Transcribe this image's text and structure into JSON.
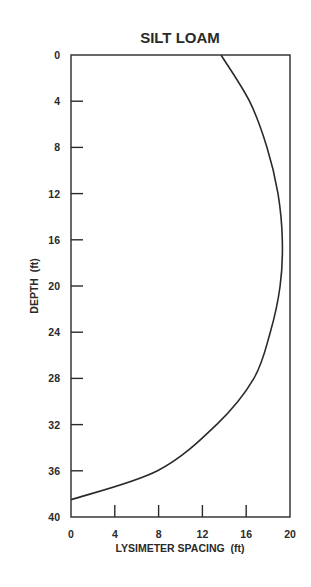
{
  "chart_data": {
    "type": "line",
    "title": "SILT LOAM",
    "xlabel": "LYSIMETER SPACING  (ft)",
    "ylabel": "DEPTH  (ft)",
    "xlim": [
      0,
      20
    ],
    "ylim": [
      0,
      40
    ],
    "y_inverted": true,
    "grid": false,
    "legend": null,
    "x_ticks": [
      0,
      4,
      8,
      12,
      16,
      20
    ],
    "y_ticks": [
      0,
      4,
      8,
      12,
      16,
      20,
      24,
      28,
      32,
      36,
      40
    ],
    "series": [
      {
        "name": "Silt loam",
        "points": [
          {
            "depth": 0,
            "spacing": 13.7
          },
          {
            "depth": 4,
            "spacing": 16.3
          },
          {
            "depth": 8,
            "spacing": 17.9
          },
          {
            "depth": 12,
            "spacing": 18.9
          },
          {
            "depth": 16,
            "spacing": 19.3
          },
          {
            "depth": 20,
            "spacing": 19.1
          },
          {
            "depth": 24,
            "spacing": 18.2
          },
          {
            "depth": 28,
            "spacing": 16.7
          },
          {
            "depth": 32,
            "spacing": 13.3
          },
          {
            "depth": 36,
            "spacing": 7.9
          },
          {
            "depth": 38.5,
            "spacing": 0
          }
        ]
      }
    ]
  },
  "colors": {
    "ink": "#2a2a2a",
    "background": "#ffffff"
  }
}
